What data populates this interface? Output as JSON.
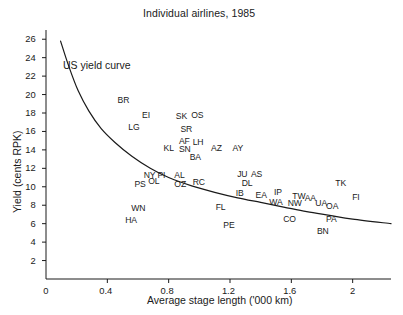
{
  "chart_data": {
    "type": "scatter",
    "title": "Individual airlines, 1985",
    "xlabel": "Average stage length ('000 km)",
    "ylabel": "Yield (cents RPK)",
    "xlim": [
      0,
      2.25
    ],
    "ylim": [
      0,
      27
    ],
    "xticks": [
      "0",
      "0.4",
      "0.8",
      "1.2",
      "1.6",
      "2"
    ],
    "xtick_values": [
      0,
      0.4,
      0.8,
      1.2,
      1.6,
      2
    ],
    "yticks": [
      "2",
      "4",
      "6",
      "8",
      "10",
      "12",
      "14",
      "16",
      "18",
      "20",
      "22",
      "24",
      "26"
    ],
    "ytick_values": [
      2,
      4,
      6,
      8,
      10,
      12,
      14,
      16,
      18,
      20,
      22,
      24,
      26
    ],
    "grid": false,
    "legend": "none",
    "annotations": [
      {
        "text": "US yield curve",
        "x": 0.16,
        "y": 22.6
      }
    ],
    "series": [
      {
        "name": "US yield curve",
        "type": "line",
        "points": [
          {
            "x": 0.095,
            "y": 25.8
          },
          {
            "x": 0.15,
            "y": 23.0
          },
          {
            "x": 0.21,
            "y": 20.4
          },
          {
            "x": 0.28,
            "y": 18.2
          },
          {
            "x": 0.36,
            "y": 16.3
          },
          {
            "x": 0.45,
            "y": 14.8
          },
          {
            "x": 0.56,
            "y": 13.3
          },
          {
            "x": 0.68,
            "y": 12.0
          },
          {
            "x": 0.8,
            "y": 11.0
          },
          {
            "x": 0.95,
            "y": 10.1
          },
          {
            "x": 1.1,
            "y": 9.4
          },
          {
            "x": 1.25,
            "y": 8.8
          },
          {
            "x": 1.4,
            "y": 8.3
          },
          {
            "x": 1.55,
            "y": 7.8
          },
          {
            "x": 1.7,
            "y": 7.3
          },
          {
            "x": 1.85,
            "y": 6.9
          },
          {
            "x": 2.0,
            "y": 6.5
          },
          {
            "x": 2.25,
            "y": 6.0
          }
        ]
      },
      {
        "name": "Individual airlines",
        "type": "scatter-labels",
        "points": [
          {
            "label": "BR",
            "x": 0.5,
            "y": 19.4
          },
          {
            "label": "EI",
            "x": 0.66,
            "y": 17.7
          },
          {
            "label": "SK",
            "x": 0.88,
            "y": 17.6
          },
          {
            "label": "OS",
            "x": 0.98,
            "y": 17.7
          },
          {
            "label": "LG",
            "x": 0.57,
            "y": 16.4
          },
          {
            "label": "SR",
            "x": 0.91,
            "y": 16.2
          },
          {
            "label": "AF",
            "x": 0.9,
            "y": 14.9
          },
          {
            "label": "LH",
            "x": 0.99,
            "y": 14.8
          },
          {
            "label": "KL",
            "x": 0.8,
            "y": 14.2
          },
          {
            "label": "SN",
            "x": 0.9,
            "y": 14.0
          },
          {
            "label": "AZ",
            "x": 1.11,
            "y": 14.2
          },
          {
            "label": "AY",
            "x": 1.25,
            "y": 14.1
          },
          {
            "label": "BA",
            "x": 0.97,
            "y": 13.2
          },
          {
            "label": "NY",
            "x": 0.67,
            "y": 11.2
          },
          {
            "label": "PI",
            "x": 0.76,
            "y": 11.2
          },
          {
            "label": "AL",
            "x": 0.87,
            "y": 11.2
          },
          {
            "label": "JU",
            "x": 1.28,
            "y": 11.3
          },
          {
            "label": "AS",
            "x": 1.37,
            "y": 11.3
          },
          {
            "label": "PS",
            "x": 0.61,
            "y": 10.2
          },
          {
            "label": "OL",
            "x": 0.7,
            "y": 10.6
          },
          {
            "label": "OZ",
            "x": 0.87,
            "y": 10.3
          },
          {
            "label": "RC",
            "x": 0.99,
            "y": 10.5
          },
          {
            "label": "DL",
            "x": 1.31,
            "y": 10.4
          },
          {
            "label": "TK",
            "x": 1.92,
            "y": 10.4
          },
          {
            "label": "IB",
            "x": 1.27,
            "y": 9.3
          },
          {
            "label": "EA",
            "x": 1.4,
            "y": 9.1
          },
          {
            "label": "IP",
            "x": 1.52,
            "y": 9.4
          },
          {
            "label": "TW",
            "x": 1.64,
            "y": 9.0
          },
          {
            "label": "AA",
            "x": 1.72,
            "y": 8.7
          },
          {
            "label": "FI",
            "x": 2.03,
            "y": 8.8
          },
          {
            "label": "WA",
            "x": 1.49,
            "y": 8.3
          },
          {
            "label": "NW",
            "x": 1.61,
            "y": 8.2
          },
          {
            "label": "UA",
            "x": 1.79,
            "y": 8.2
          },
          {
            "label": "OA",
            "x": 1.86,
            "y": 7.9
          },
          {
            "label": "WN",
            "x": 0.59,
            "y": 7.6
          },
          {
            "label": "FL",
            "x": 1.14,
            "y": 7.7
          },
          {
            "label": "HA",
            "x": 0.55,
            "y": 6.3
          },
          {
            "label": "CO",
            "x": 1.58,
            "y": 6.5
          },
          {
            "label": "PA",
            "x": 1.86,
            "y": 6.4
          },
          {
            "label": "PE",
            "x": 1.19,
            "y": 5.8
          },
          {
            "label": "BN",
            "x": 1.8,
            "y": 5.1
          }
        ]
      }
    ]
  }
}
